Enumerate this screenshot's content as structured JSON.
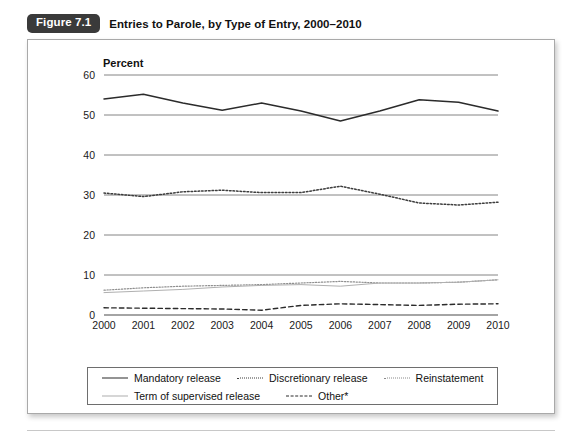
{
  "figure": {
    "badge": "Figure 7.1",
    "title": "Entries to Parole, by Type of Entry, 2000–2010"
  },
  "axis": {
    "y_title": "Percent"
  },
  "legend": {
    "items": [
      {
        "label": "Mandatory release",
        "style": "solid-thick",
        "color": "#2b2b2b"
      },
      {
        "label": "Discretionary release",
        "style": "dotted",
        "color": "#3d3d3d"
      },
      {
        "label": "Reinstatement",
        "style": "dotted-light",
        "color": "#8a8a8a"
      },
      {
        "label": "Term of supervised release",
        "style": "solid-light",
        "color": "#aeaeae"
      },
      {
        "label": "Other*",
        "style": "dashed",
        "color": "#2b2b2b"
      }
    ]
  },
  "chart_data": {
    "type": "line",
    "title": "Entries to Parole, by Type of Entry, 2000–2010",
    "xlabel": "",
    "ylabel": "Percent",
    "ylim": [
      0,
      60
    ],
    "yticks": [
      0,
      10,
      20,
      30,
      40,
      50,
      60
    ],
    "grid": true,
    "legend_position": "bottom",
    "categories": [
      "2000",
      "2001",
      "2002",
      "2003",
      "2004",
      "2005",
      "2006",
      "2007",
      "2008",
      "2009",
      "2010"
    ],
    "series": [
      {
        "name": "Mandatory release",
        "values": [
          54.0,
          55.2,
          53.0,
          51.2,
          53.0,
          51.0,
          48.5,
          51.0,
          53.8,
          53.2,
          51.0
        ]
      },
      {
        "name": "Discretionary release",
        "values": [
          30.5,
          29.6,
          30.8,
          31.2,
          30.6,
          30.6,
          32.2,
          30.2,
          28.0,
          27.5,
          28.2
        ]
      },
      {
        "name": "Reinstatement",
        "values": [
          6.2,
          6.8,
          7.2,
          7.4,
          7.6,
          8.0,
          8.4,
          8.0,
          8.0,
          8.2,
          8.8
        ]
      },
      {
        "name": "Term of supervised release",
        "values": [
          5.6,
          6.0,
          6.4,
          7.0,
          7.4,
          7.6,
          7.2,
          8.0,
          8.0,
          8.2,
          8.8
        ]
      },
      {
        "name": "Other*",
        "values": [
          1.8,
          1.7,
          1.6,
          1.5,
          1.2,
          2.4,
          2.8,
          2.6,
          2.4,
          2.7,
          2.8
        ]
      }
    ]
  },
  "footer": {
    "caption": ""
  }
}
